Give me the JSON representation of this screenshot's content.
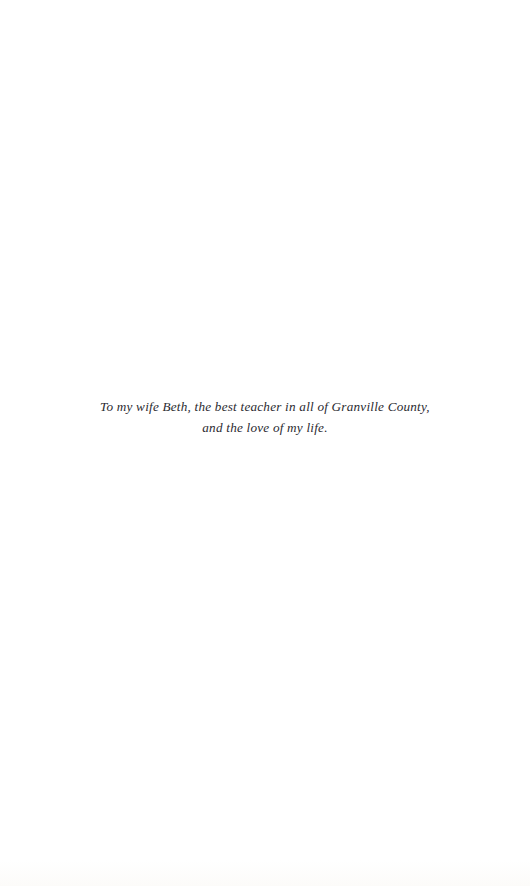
{
  "page": {
    "kind": "book-dedication-page",
    "width": 530,
    "height": 886,
    "background_color": "#ffffff",
    "text_color": "#2b2b31"
  },
  "dedication": {
    "lines": [
      "To my wife Beth, the best teacher in all of Granville County,",
      "and the love of my life."
    ],
    "full_text": "To my wife Beth, the best teacher in all of Granville County, and the love of my life.",
    "alignment": "center",
    "style": "italic-serif"
  }
}
